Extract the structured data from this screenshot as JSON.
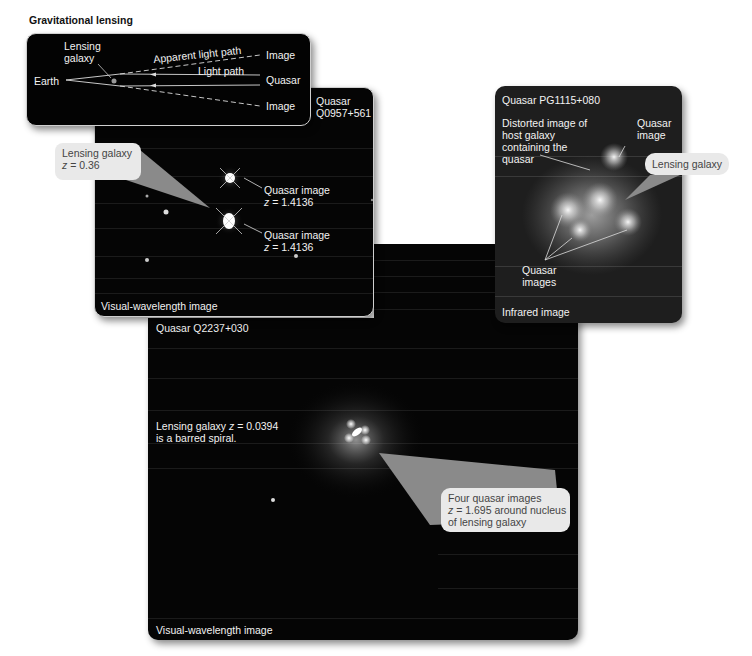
{
  "figure": {
    "title": "Gravitational lensing"
  },
  "diagram": {
    "lensing_galaxy_label_line1": "Lensing",
    "lensing_galaxy_label_line2": "galaxy",
    "apparent_path_label": "Apparent light path",
    "light_path_label": "Light path",
    "earth_label": "Earth",
    "quasar_label": "Quasar",
    "image_top_label": "Image",
    "image_bottom_label": "Image"
  },
  "panel_q0957": {
    "title_line1": "Quasar",
    "title_line2": "Q0957+561",
    "callout_line1": "Lensing galaxy",
    "callout_z": "z",
    "callout_value": " = 0.36",
    "image1_line1": "Quasar image",
    "image1_z": "z",
    "image1_value": " = 1.4136",
    "image2_line1": "Quasar image",
    "image2_z": "z",
    "image2_value": " = 1.4136",
    "caption": "Visual-wavelength image"
  },
  "panel_pg1115": {
    "title": "Quasar PG1115+080",
    "host_line1": "Distorted image of",
    "host_line2": "host galaxy",
    "host_line3": "containing the",
    "host_line4": "quasar",
    "quasar_image_line1": "Quasar",
    "quasar_image_line2": "image",
    "callout": "Lensing galaxy",
    "quasar_images_line1": "Quasar",
    "quasar_images_line2": "images",
    "caption": "Infrared image"
  },
  "panel_q2237": {
    "title": "Quasar Q2237+030",
    "galaxy_line1_pre": "Lensing galaxy ",
    "galaxy_z": "z",
    "galaxy_value": " = 0.0394",
    "galaxy_line2": "is a barred spiral.",
    "callout_line1": "Four quasar images",
    "callout_z": "z",
    "callout_line2_rest": " = 1.695 around nucleus",
    "callout_line3": "of lensing galaxy",
    "caption": "Visual-wavelength image"
  },
  "colors": {
    "panel_bg": "#050505",
    "callout_bg": "#e9e9e9",
    "callout_text": "#444444",
    "label_text": "#f2f2f2",
    "wedge": "#8a8a8a"
  }
}
